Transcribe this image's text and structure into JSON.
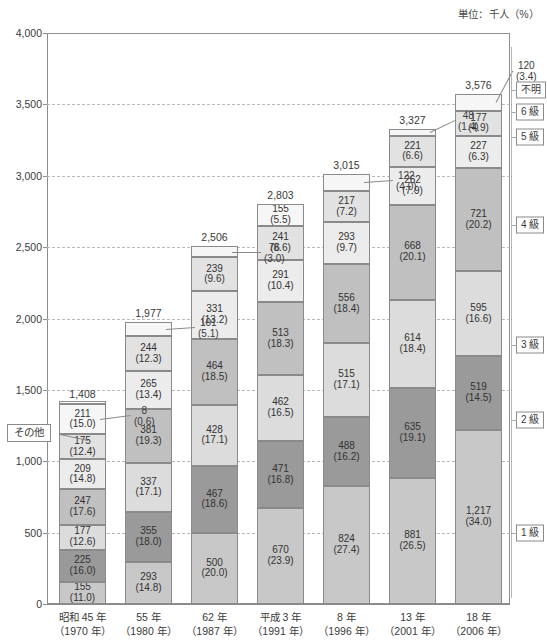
{
  "unit_note": "単位：千人（%）",
  "annotation_other": "その他",
  "axis": {
    "y_ticks": [
      "0",
      "500",
      "1,000",
      "1,500",
      "2,000",
      "2,500",
      "3,000",
      "3,500",
      "4,000"
    ],
    "y_min": 0,
    "y_max": 4000
  },
  "legend": {
    "items": [
      {
        "key": "unknown",
        "label": "不明"
      },
      {
        "key": "grade6",
        "label": "6 級"
      },
      {
        "key": "grade5",
        "label": "5 級"
      },
      {
        "key": "grade4",
        "label": "4 級"
      },
      {
        "key": "grade3",
        "label": "3 級"
      },
      {
        "key": "grade2",
        "label": "2 級"
      },
      {
        "key": "grade1",
        "label": "1 級"
      }
    ]
  },
  "colors": {
    "grade1": "#c8c8c8",
    "grade2": "#9a9a9a",
    "grade3": "#dcdcdc",
    "grade4": "#c0c0c0",
    "grade5": "#ececec",
    "grade6": "#e2e2e2",
    "unknown": "#f6f6f6",
    "frame": "#8a8a8a",
    "grid": "#b9b9b9",
    "text": "#3a3a3a"
  },
  "chart_data": {
    "type": "bar",
    "stacked": true,
    "title": "",
    "subtitle": "",
    "xlabel": "",
    "ylabel": "",
    "ylim": [
      0,
      4000
    ],
    "yticks": [
      0,
      500,
      1000,
      1500,
      2000,
      2500,
      3000,
      3500,
      4000
    ],
    "grid": true,
    "legend_position": "right",
    "units": "単位：千人（%）",
    "categories": [
      {
        "line1": "昭和 45 年",
        "line2": "（1970 年）"
      },
      {
        "line1": "55 年",
        "line2": "（1980 年）"
      },
      {
        "line1": "62 年",
        "line2": "（1987 年）"
      },
      {
        "line1": "平成 3 年",
        "line2": "（1991 年）"
      },
      {
        "line1": "8 年",
        "line2": "（1996 年）"
      },
      {
        "line1": "13 年",
        "line2": "（2001 年）"
      },
      {
        "line1": "18 年",
        "line2": "（2006 年）"
      }
    ],
    "totals": [
      "1,408",
      "1,977",
      "2,506",
      "2,803",
      "3,015",
      "3,327",
      "3,576"
    ],
    "totals_numeric": [
      1408,
      1977,
      2506,
      2803,
      3015,
      3327,
      3576
    ],
    "series": [
      {
        "name": "1 級",
        "key": "grade1",
        "values": [
          155,
          293,
          500,
          670,
          824,
          881,
          1217
        ],
        "percents": [
          11.0,
          14.8,
          20.0,
          23.9,
          27.4,
          26.5,
          34.0
        ],
        "labels": [
          "155",
          "293",
          "500",
          "670",
          "824",
          "881",
          "1,217"
        ],
        "plabels": [
          "(11.0)",
          "(14.8)",
          "(20.0)",
          "(23.9)",
          "(27.4)",
          "(26.5)",
          "(34.0)"
        ]
      },
      {
        "name": "2 級",
        "key": "grade2",
        "values": [
          225,
          355,
          467,
          471,
          488,
          635,
          519
        ],
        "percents": [
          16.0,
          18.0,
          18.6,
          16.8,
          16.2,
          19.1,
          14.5
        ],
        "labels": [
          "225",
          "355",
          "467",
          "471",
          "488",
          "635",
          "519"
        ],
        "plabels": [
          "(16.0)",
          "(18.0)",
          "(18.6)",
          "(16.8)",
          "(16.2)",
          "(19.1)",
          "(14.5)"
        ]
      },
      {
        "name": "3 級",
        "key": "grade3",
        "values": [
          177,
          337,
          428,
          462,
          515,
          614,
          595
        ],
        "percents": [
          12.6,
          17.1,
          17.1,
          16.5,
          17.1,
          18.4,
          16.6
        ],
        "labels": [
          "177",
          "337",
          "428",
          "462",
          "515",
          "614",
          "595"
        ],
        "plabels": [
          "(12.6)",
          "(17.1)",
          "(17.1)",
          "(16.5)",
          "(17.1)",
          "(18.4)",
          "(16.6)"
        ]
      },
      {
        "name": "4 級",
        "key": "grade4",
        "values": [
          247,
          381,
          464,
          513,
          556,
          668,
          721
        ],
        "percents": [
          17.6,
          19.3,
          18.5,
          18.3,
          18.4,
          20.1,
          20.2
        ],
        "labels": [
          "247",
          "381",
          "464",
          "513",
          "556",
          "668",
          "721"
        ],
        "plabels": [
          "(17.6)",
          "(19.3)",
          "(18.5)",
          "(18.3)",
          "(18.4)",
          "(20.1)",
          "(20.2)"
        ]
      },
      {
        "name": "5 級",
        "key": "grade5",
        "values": [
          209,
          265,
          331,
          291,
          293,
          262,
          227
        ],
        "percents": [
          14.8,
          13.4,
          13.2,
          10.4,
          9.7,
          7.9,
          6.3
        ],
        "labels": [
          "209",
          "265",
          "331",
          "291",
          "293",
          "262",
          "227"
        ],
        "plabels": [
          "(14.8)",
          "(13.4)",
          "(13.2)",
          "(10.4)",
          "(9.7)",
          "(7.9)",
          "(6.3)"
        ]
      },
      {
        "name": "6 級",
        "key": "grade6",
        "values": [
          175,
          244,
          239,
          241,
          217,
          221,
          177
        ],
        "percents": [
          12.4,
          12.3,
          9.6,
          8.6,
          7.2,
          6.6,
          4.9
        ],
        "labels": [
          "175",
          "244",
          "239",
          "241",
          "217",
          "221",
          "177"
        ],
        "plabels": [
          "(12.4)",
          "(12.3)",
          "(9.6)",
          "(8.6)",
          "(7.2)",
          "(6.6)",
          "(4.9)"
        ]
      },
      {
        "name": "不明",
        "key": "unknown",
        "values": [
          211,
          101,
          76,
          155,
          122,
          48,
          120
        ],
        "percents": [
          15.0,
          5.1,
          3.0,
          5.5,
          4.0,
          1.4,
          3.4
        ],
        "labels": [
          "211",
          "101",
          "76",
          "155",
          "122",
          "48",
          "120"
        ],
        "plabels": [
          "(15.0)",
          "(5.1)",
          "(3.0)",
          "(5.5)",
          "(4.0)",
          "(1.4)",
          "(3.4)"
        ]
      },
      {
        "name": "その他",
        "key": "other",
        "values": [
          8,
          0,
          0,
          0,
          0,
          0,
          0
        ],
        "percents": [
          0.6,
          0,
          0,
          0,
          0,
          0,
          0
        ],
        "labels": [
          "8",
          "",
          "",
          "",
          "",
          "",
          ""
        ],
        "plabels": [
          "(0.6)",
          "",
          "",
          "",
          "",
          "",
          ""
        ]
      }
    ],
    "external_callouts": [
      {
        "bar_index": 0,
        "value": "8",
        "percent": "(0.6)"
      },
      {
        "bar_index": 1,
        "value": "101",
        "percent": "(5.1)"
      },
      {
        "bar_index": 2,
        "value": "76",
        "percent": "(3.0)"
      },
      {
        "bar_index": 4,
        "value": "122",
        "percent": "(4.0)"
      },
      {
        "bar_index": 5,
        "value": "48",
        "percent": "(1.4)"
      },
      {
        "bar_index": 6,
        "value": "120",
        "percent": "(3.4)"
      }
    ]
  }
}
